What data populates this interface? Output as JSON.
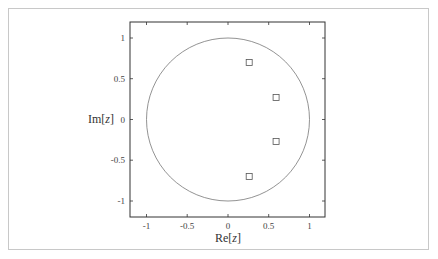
{
  "chart_data": {
    "type": "scatter",
    "title": "",
    "xlabel": "Re[z]",
    "ylabel": "Im[z]",
    "xlim": [
      -1.2,
      1.2
    ],
    "ylim": [
      -1.2,
      1.2
    ],
    "grid": false,
    "x_ticks": [
      "-1",
      "-0.5",
      "0",
      "0.5",
      "1"
    ],
    "y_ticks": [
      "1",
      "0.5",
      "0",
      "-0.5",
      "-1"
    ],
    "annotations": [
      "unit circle |z| = 1"
    ],
    "series": [
      {
        "name": "poles",
        "marker": "square",
        "points": [
          {
            "x": 0.26,
            "y": 0.7
          },
          {
            "x": 0.59,
            "y": 0.27
          },
          {
            "x": 0.59,
            "y": -0.27
          },
          {
            "x": 0.26,
            "y": -0.7
          }
        ]
      }
    ],
    "colors": {
      "line": "#777777",
      "frame": "#333333"
    }
  },
  "labels": {
    "xlabel_re": "Re[",
    "xlabel_z": "z",
    "xlabel_close": "]",
    "ylabel_im": "Im[",
    "ylabel_z": "z",
    "ylabel_close": "]",
    "xt0": "-1",
    "xt1": "-0.5",
    "xt2": "0",
    "xt3": "0.5",
    "xt4": "1",
    "yt0": "1",
    "yt1": "0.5",
    "yt2": "0",
    "yt3": "-0.5",
    "yt4": "-1"
  }
}
